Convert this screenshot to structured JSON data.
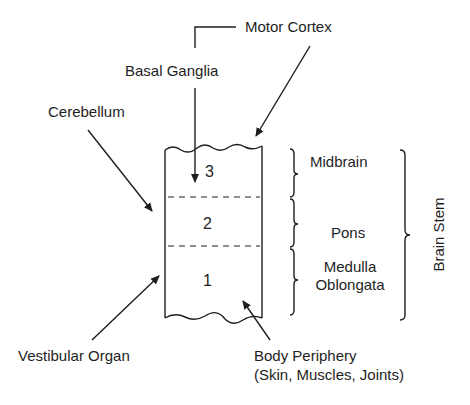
{
  "diagram": {
    "inputs": {
      "motor_cortex": "Motor Cortex",
      "basal_ganglia": "Basal Ganglia",
      "cerebellum": "Cerebellum",
      "vestibular_organ": "Vestibular Organ",
      "body_periphery_line1": "Body Periphery",
      "body_periphery_line2": "(Skin, Muscles, Joints)"
    },
    "levels": [
      {
        "number": "3",
        "region": "Midbrain"
      },
      {
        "number": "2",
        "region": "Pons"
      },
      {
        "number": "1",
        "region_line1": "Medulla",
        "region_line2": "Oblongata"
      }
    ],
    "group_label": "Brain Stem"
  }
}
